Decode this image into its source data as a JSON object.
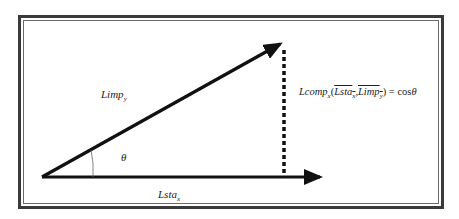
{
  "diagram": {
    "vectors": {
      "limp": {
        "base": "Limp",
        "sub": "y"
      },
      "lsta": {
        "base": "Lsta",
        "sub": "x"
      }
    },
    "angle_label": "θ",
    "formula": {
      "lhs_base": "Lcomp",
      "lhs_sub": "x",
      "open": "(",
      "arg1_base": "Lsta",
      "arg1_sub": "x",
      "comma": ",",
      "arg2_base": "Limp",
      "arg2_sub": "y",
      "close": ")",
      "equals": " = ",
      "rhs_fn": "cos",
      "rhs_var": "θ"
    },
    "colors": {
      "stroke": "#111111",
      "border": "#3a3a3a"
    }
  }
}
